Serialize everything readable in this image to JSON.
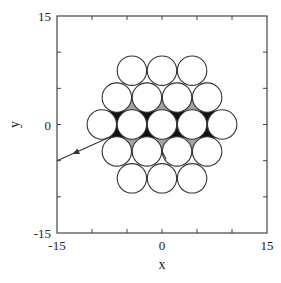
{
  "chart_data": {
    "type": "scatter",
    "title": "",
    "xlabel": "x",
    "ylabel": "y",
    "xlim": [
      -15,
      15
    ],
    "ylim": [
      -15,
      15
    ],
    "x_tick_labels": [
      "-15",
      "0",
      "15"
    ],
    "y_tick_labels": [
      "15",
      "0",
      "-15"
    ],
    "x_tick_values": [
      -15,
      0,
      15
    ],
    "y_tick_values": [
      15,
      0,
      -15
    ],
    "minor_tick_step": 5,
    "grid": false,
    "legend": "none",
    "scatterers": {
      "shape": "circle",
      "radius": 2.1,
      "lattice": "hexagonal",
      "spacing": 4.3,
      "rows": [
        {
          "y_index": 2,
          "count": 3
        },
        {
          "y_index": 1,
          "count": 4
        },
        {
          "y_index": 0,
          "count": 5
        },
        {
          "y_index": -1,
          "count": 4
        },
        {
          "y_index": -2,
          "count": 3
        }
      ]
    },
    "trajectory": {
      "description": "exiting ray with arrow",
      "start": [
        -7.1,
        -1.6
      ],
      "end": [
        -15,
        -5.0
      ],
      "arrow_at": [
        -11.9,
        -3.7
      ]
    },
    "stub_segment": {
      "start": [
        0,
        -3.7
      ],
      "end": [
        0.6,
        -4.8
      ]
    },
    "dense_regions": "interior interstitial gaps filled by trajectory traces",
    "colors": {
      "line": "#333333",
      "fill": "#111111",
      "background": "#ffffff"
    }
  }
}
